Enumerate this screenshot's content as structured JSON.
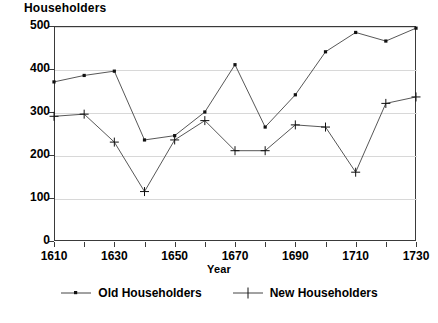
{
  "chart_data": {
    "type": "line",
    "title": "",
    "ylabel": "Householders",
    "xlabel": "Year",
    "xlim": [
      1610,
      1730
    ],
    "ylim": [
      0,
      500
    ],
    "grid": true,
    "legend_position": "bottom",
    "x": [
      1610,
      1620,
      1630,
      1640,
      1650,
      1660,
      1670,
      1680,
      1690,
      1700,
      1710,
      1720,
      1730
    ],
    "xticks": [
      1610,
      1630,
      1650,
      1670,
      1690,
      1710,
      1730
    ],
    "xtick_labels": [
      "1610",
      "1630",
      "1650",
      "1670",
      "1690",
      "1710",
      "1730"
    ],
    "yticks": [
      0,
      100,
      200,
      300,
      400,
      500
    ],
    "ytick_labels": [
      "0",
      "100",
      "200",
      "300",
      "400",
      "500"
    ],
    "series": [
      {
        "name": "Old Householders",
        "marker": "square-dot",
        "values": [
          370,
          385,
          395,
          235,
          245,
          300,
          410,
          265,
          340,
          440,
          485,
          465,
          495
        ]
      },
      {
        "name": "New Householders",
        "marker": "plus",
        "values": [
          290,
          295,
          230,
          115,
          235,
          280,
          210,
          210,
          270,
          265,
          160,
          320,
          335
        ]
      }
    ]
  },
  "legend": {
    "items": [
      {
        "label": "Old Householders"
      },
      {
        "label": "New Householders"
      }
    ]
  },
  "colors": {
    "line": "#444444",
    "frame": "#3a3a3a",
    "grid": "#d8d8d8",
    "text": "#000000",
    "background": "#ffffff"
  }
}
